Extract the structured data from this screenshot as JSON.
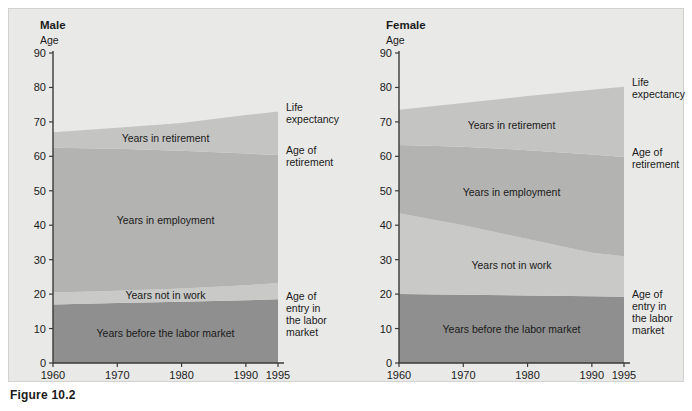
{
  "figure": {
    "caption": "Figure 10.2",
    "background_color": "#e9e9e7"
  },
  "colors": {
    "years_before_labor_market": "#8f8f8f",
    "years_not_in_work": "#c9c9c7",
    "years_in_employment": "#b3b3b1",
    "years_in_retirement": "#c4c4c2",
    "above_life_expectancy": "#e9e9e7",
    "axis": "#3b3b3b",
    "text": "#1a1a1a"
  },
  "panels": [
    {
      "id": "male",
      "title": "Male",
      "axis_title": "Age",
      "y_ticks": [
        "0",
        "10",
        "20",
        "30",
        "40",
        "50",
        "60",
        "70",
        "80",
        "90"
      ],
      "x_ticks": [
        "1960",
        "1970",
        "1980",
        "1990",
        "1995"
      ],
      "band_labels": [
        "Years in retirement",
        "Years in employment",
        "Years not in work",
        "Years before the labor market"
      ],
      "side_labels": [
        "Life expectancy",
        "Age of retirement",
        "Age of entry in the labor market"
      ]
    },
    {
      "id": "female",
      "title": "Female",
      "axis_title": "Age",
      "y_ticks": [
        "0",
        "10",
        "20",
        "30",
        "40",
        "50",
        "60",
        "70",
        "80",
        "90"
      ],
      "x_ticks": [
        "1960",
        "1970",
        "1980",
        "1990",
        "1995"
      ],
      "band_labels": [
        "Years in retirement",
        "Years in employment",
        "Years not in work",
        "Years before the labor market"
      ],
      "side_labels": [
        "Life expectancy",
        "Age of retirement",
        "Age of entry in the labor market"
      ]
    }
  ],
  "chart_data": {
    "type": "area",
    "xlabel": "",
    "ylabel": "Age",
    "ylim": [
      0,
      90
    ],
    "xlim": [
      1960,
      1995
    ],
    "grid": false,
    "legend_position": "right-of-plot (direct labels)",
    "x": [
      1960,
      1970,
      1980,
      1990,
      1995
    ],
    "panels": [
      {
        "name": "Male",
        "series": [
          {
            "name": "Age of entry in the labor market",
            "values": [
              17,
              17.4,
              17.8,
              18.2,
              18.5
            ]
          },
          {
            "name": "Start of employment (end of years not in work)",
            "values": [
              20.5,
              21.0,
              21.6,
              22.6,
              23.2
            ]
          },
          {
            "name": "Age of retirement",
            "values": [
              62.5,
              62.2,
              61.6,
              60.8,
              60.4
            ]
          },
          {
            "name": "Life expectancy",
            "values": [
              67.0,
              68.3,
              69.7,
              72.0,
              73.0
            ]
          }
        ],
        "bands": [
          {
            "name": "Years before the labor market",
            "from": "0",
            "to": "Age of entry in the labor market"
          },
          {
            "name": "Years not in work",
            "from": "Age of entry in the labor market",
            "to": "Start of employment"
          },
          {
            "name": "Years in employment",
            "from": "Start of employment",
            "to": "Age of retirement"
          },
          {
            "name": "Years in retirement",
            "from": "Age of retirement",
            "to": "Life expectancy"
          }
        ]
      },
      {
        "name": "Female",
        "series": [
          {
            "name": "Age of entry in the labor market",
            "values": [
              20.0,
              19.8,
              19.6,
              19.4,
              19.2
            ]
          },
          {
            "name": "Start of employment (end of years not in work)",
            "values": [
              43.5,
              40.0,
              36.0,
              32.0,
              31.0
            ]
          },
          {
            "name": "Age of retirement",
            "values": [
              63.3,
              62.8,
              61.8,
              60.5,
              59.8
            ]
          },
          {
            "name": "Life expectancy",
            "values": [
              73.5,
              75.5,
              77.5,
              79.3,
              80.2
            ]
          }
        ],
        "bands": [
          {
            "name": "Years before the labor market",
            "from": "0",
            "to": "Age of entry in the labor market"
          },
          {
            "name": "Years not in work",
            "from": "Age of entry in the labor market",
            "to": "Start of employment"
          },
          {
            "name": "Years in employment",
            "from": "Start of employment",
            "to": "Age of retirement"
          },
          {
            "name": "Years in retirement",
            "from": "Age of retirement",
            "to": "Life expectancy"
          }
        ]
      }
    ]
  }
}
